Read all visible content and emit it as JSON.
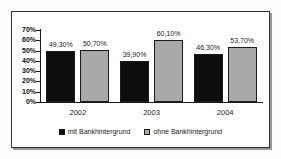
{
  "chart_data": {
    "type": "bar",
    "title": "",
    "subtitle": "",
    "xlabel": "",
    "ylabel": "",
    "categories": [
      "2002",
      "2003",
      "2004"
    ],
    "series": [
      {
        "name": "mit Bankhintergrund",
        "color": "#0d0d0d",
        "values": [
          49.3,
          60.1,
          46.3
        ],
        "labels": [
          "49,30%",
          "39,90%",
          "46,30%"
        ],
        "actual_values": [
          49.3,
          39.9,
          46.3
        ]
      },
      {
        "name": "ohne Bankhintergrund",
        "color": "#a9a9a9",
        "values": [
          50.7,
          60.1,
          53.7
        ],
        "labels": [
          "50,70%",
          "60,10%",
          "53,70%"
        ],
        "actual_values": [
          50.7,
          60.1,
          53.7
        ]
      }
    ],
    "ylim": [
      0,
      70
    ],
    "ytick_values": [
      0,
      10,
      20,
      30,
      40,
      50,
      60,
      70
    ],
    "ytick_labels": [
      "0%",
      "10%",
      "20%",
      "30%",
      "40%",
      "50%",
      "60%",
      "70%"
    ],
    "grid": false,
    "legend_position": "bottom-center"
  },
  "legend": {
    "items": [
      {
        "label": "mit Bankhintergrund",
        "swatch": "black-square-swatch"
      },
      {
        "label": "ohne Bankhintergrund",
        "swatch": "gray-square-swatch"
      }
    ]
  }
}
